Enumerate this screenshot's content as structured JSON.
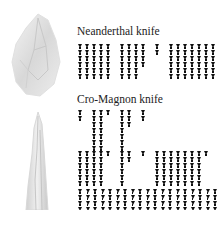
{
  "sections": [
    {
      "title": "Neanderthal knife"
    },
    {
      "title": "Cro-Magnon knife"
    }
  ],
  "images": [
    {
      "name": "neanderthal-knife-image"
    },
    {
      "name": "cro-magnon-knife-image"
    }
  ],
  "grids": {
    "neanderthal": {
      "origin": [
        78,
        44
      ],
      "step": [
        7,
        6
      ],
      "columns": [
        {
          "x": 0,
          "count": 6
        },
        {
          "x": 1,
          "count": 6
        },
        {
          "x": 2,
          "count": 6
        },
        {
          "x": 3,
          "count": 6
        },
        {
          "x": 4,
          "count": 6
        },
        {
          "x": 6,
          "count": 6
        },
        {
          "x": 7,
          "count": 6
        },
        {
          "x": 8,
          "count": 6
        },
        {
          "x": 9,
          "count": 4
        },
        {
          "x": 11,
          "count": 2
        },
        {
          "x": 13,
          "count": 6
        },
        {
          "x": 14,
          "count": 6
        },
        {
          "x": 15,
          "count": 6
        },
        {
          "x": 16,
          "count": 6
        },
        {
          "x": 17,
          "count": 6
        },
        {
          "x": 18,
          "count": 6
        },
        {
          "x": 19,
          "count": 6
        }
      ]
    },
    "cromagnon_a": {
      "origin": [
        78,
        110
      ],
      "step": [
        7,
        6
      ],
      "columns": [
        {
          "x": 0,
          "count": 2
        },
        {
          "x": 2,
          "count": 7
        },
        {
          "x": 3,
          "count": 7
        },
        {
          "x": 4,
          "count": 1
        },
        {
          "x": 6,
          "count": 7
        },
        {
          "x": 7,
          "count": 3
        },
        {
          "x": 9,
          "count": 2
        }
      ]
    },
    "cromagnon_b": {
      "origin": [
        78,
        151
      ],
      "step": [
        7,
        6
      ],
      "columns": [
        {
          "x": 0,
          "count": 6
        },
        {
          "x": 1,
          "count": 6
        },
        {
          "x": 2,
          "count": 6
        },
        {
          "x": 3,
          "count": 6
        },
        {
          "x": 4,
          "count": 1
        },
        {
          "x": 6,
          "count": 6
        },
        {
          "x": 7,
          "count": 2
        },
        {
          "x": 9,
          "count": 1
        },
        {
          "x": 11,
          "count": 6
        },
        {
          "x": 12,
          "count": 6
        },
        {
          "x": 13,
          "count": 6
        },
        {
          "x": 14,
          "count": 6
        },
        {
          "x": 15,
          "count": 6
        },
        {
          "x": 16,
          "count": 6
        },
        {
          "x": 17,
          "count": 6
        },
        {
          "x": 18,
          "count": 1
        }
      ]
    },
    "cromagnon_c": {
      "origin": [
        78,
        189
      ],
      "step": [
        7.5,
        6
      ],
      "columns": [
        {
          "x": 0,
          "count": 4
        },
        {
          "x": 1,
          "count": 4
        },
        {
          "x": 2,
          "count": 4
        },
        {
          "x": 3,
          "count": 4
        },
        {
          "x": 4,
          "count": 4
        },
        {
          "x": 5,
          "count": 4
        },
        {
          "x": 6,
          "count": 4
        },
        {
          "x": 7,
          "count": 4
        },
        {
          "x": 8,
          "count": 4
        },
        {
          "x": 9,
          "count": 4
        },
        {
          "x": 10,
          "count": 4
        },
        {
          "x": 11,
          "count": 4
        },
        {
          "x": 12,
          "count": 4
        },
        {
          "x": 13,
          "count": 4
        },
        {
          "x": 14,
          "count": 4
        },
        {
          "x": 15,
          "count": 4
        },
        {
          "x": 16,
          "count": 4
        },
        {
          "x": 17,
          "count": 4
        },
        {
          "x": 18,
          "count": 4
        }
      ]
    }
  }
}
